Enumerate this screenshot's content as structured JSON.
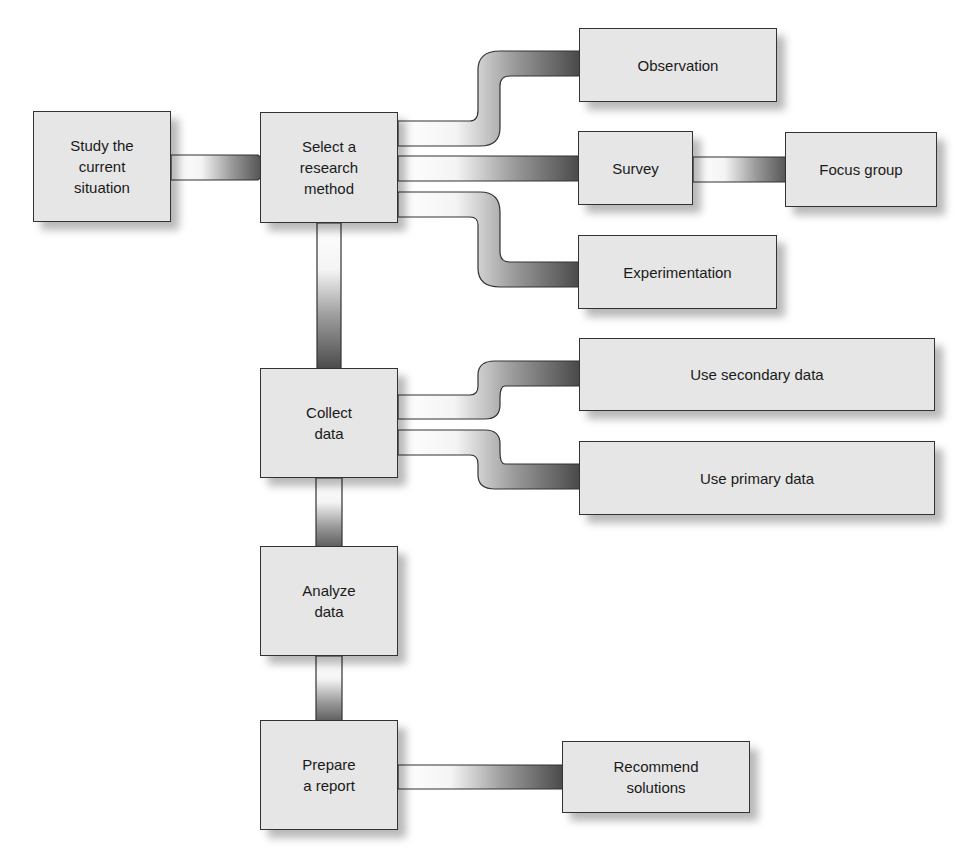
{
  "diagram": {
    "type": "flowchart",
    "title": "",
    "nodes": [
      {
        "id": "study",
        "label": "Study the\ncurrent\nsituation"
      },
      {
        "id": "select",
        "label": "Select a\nresearch\nmethod"
      },
      {
        "id": "observation",
        "label": "Observation"
      },
      {
        "id": "survey",
        "label": "Survey"
      },
      {
        "id": "focus",
        "label": "Focus group"
      },
      {
        "id": "experimentation",
        "label": "Experimentation"
      },
      {
        "id": "collect",
        "label": "Collect\ndata"
      },
      {
        "id": "secondary",
        "label": "Use secondary data"
      },
      {
        "id": "primary",
        "label": "Use primary data"
      },
      {
        "id": "analyze",
        "label": "Analyze\ndata"
      },
      {
        "id": "prepare",
        "label": "Prepare\na report"
      },
      {
        "id": "recommend",
        "label": "Recommend\nsolutions"
      }
    ],
    "edges": [
      {
        "from": "study",
        "to": "select"
      },
      {
        "from": "select",
        "to": "observation"
      },
      {
        "from": "select",
        "to": "survey"
      },
      {
        "from": "select",
        "to": "experimentation"
      },
      {
        "from": "survey",
        "to": "focus"
      },
      {
        "from": "select",
        "to": "collect"
      },
      {
        "from": "collect",
        "to": "secondary"
      },
      {
        "from": "collect",
        "to": "primary"
      },
      {
        "from": "collect",
        "to": "analyze"
      },
      {
        "from": "analyze",
        "to": "prepare"
      },
      {
        "from": "prepare",
        "to": "recommend"
      }
    ],
    "colors": {
      "box_fill": "#e6e6e6",
      "box_border": "#333333",
      "arrow_dark": "#3a3a3a",
      "arrow_light": "#ffffff"
    }
  }
}
